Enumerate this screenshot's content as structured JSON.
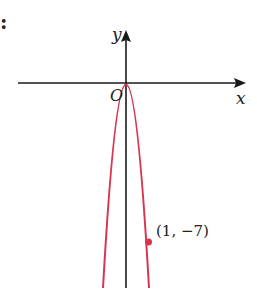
{
  "diagram": {
    "type": "parabola-graph",
    "equation_hint": "y = -7x^2",
    "axes": {
      "x_label": "x",
      "y_label": "y",
      "origin_label": "O"
    },
    "point": {
      "label": "(1, −7)",
      "x": 1,
      "y": -7
    },
    "colors": {
      "curve": "#d9354f",
      "axes": "#1a1a1a"
    },
    "margin_mark": ":"
  }
}
